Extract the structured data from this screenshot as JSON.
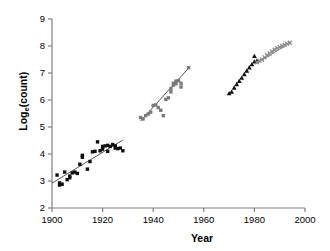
{
  "chart_data": {
    "type": "scatter",
    "title": "",
    "xlabel": "Year",
    "ylabel": "Log",
    "ylabel_sub": "e",
    "ylabel_tail": "(count)",
    "ylabel_full": "Log_e(count)",
    "xlim": [
      1900,
      2000
    ],
    "ylim": [
      2,
      9
    ],
    "xticks": [
      1900,
      1920,
      1940,
      1960,
      1980,
      2000
    ],
    "xtick_labels": [
      "1900",
      "1920",
      "1940",
      "1960",
      "1980",
      "2000"
    ],
    "yticks": [
      2,
      3,
      4,
      5,
      6,
      7,
      8,
      9
    ],
    "ytick_labels": [
      "2",
      "3",
      "4",
      "5",
      "6",
      "7",
      "8",
      "9"
    ],
    "grid": false,
    "legend": "none",
    "axis_color": "#808080",
    "series": [
      {
        "name": "early-period-black-squares",
        "marker": "square",
        "color": "#101010",
        "size": 3.4,
        "points": [
          [
            1902,
            3.22
          ],
          [
            1903,
            2.93
          ],
          [
            1903,
            2.85
          ],
          [
            1904,
            2.88
          ],
          [
            1905,
            3.33
          ],
          [
            1906,
            3.05
          ],
          [
            1907,
            3.18
          ],
          [
            1907,
            3.12
          ],
          [
            1908,
            3.3
          ],
          [
            1909,
            3.33
          ],
          [
            1910,
            3.28
          ],
          [
            1911,
            3.62
          ],
          [
            1912,
            3.95
          ],
          [
            1912,
            3.88
          ],
          [
            1914,
            3.44
          ],
          [
            1915,
            3.72
          ],
          [
            1916,
            4.08
          ],
          [
            1917,
            4.1
          ],
          [
            1918,
            4.45
          ],
          [
            1919,
            4.12
          ],
          [
            1920,
            4.18
          ],
          [
            1920,
            4.28
          ],
          [
            1921,
            4.3
          ],
          [
            1922,
            4.32
          ],
          [
            1922,
            4.1
          ],
          [
            1923,
            4.28
          ],
          [
            1924,
            4.35
          ],
          [
            1925,
            4.3
          ],
          [
            1925,
            4.22
          ],
          [
            1926,
            4.2
          ],
          [
            1927,
            4.22
          ],
          [
            1928,
            4.12
          ]
        ]
      },
      {
        "name": "mid-period-gray-squares",
        "marker": "square",
        "color": "#7a7a7a",
        "size": 3.4,
        "points": [
          [
            1935,
            5.35
          ],
          [
            1936,
            5.3
          ],
          [
            1937,
            5.42
          ],
          [
            1938,
            5.48
          ],
          [
            1939,
            5.55
          ],
          [
            1940,
            5.8
          ],
          [
            1941,
            5.82
          ],
          [
            1942,
            5.72
          ],
          [
            1943,
            5.62
          ],
          [
            1944,
            5.42
          ],
          [
            1945,
            6.02
          ],
          [
            1946,
            6.08
          ],
          [
            1947,
            6.3
          ],
          [
            1947,
            6.42
          ],
          [
            1948,
            6.55
          ],
          [
            1948,
            6.62
          ],
          [
            1949,
            6.7
          ],
          [
            1949,
            6.6
          ],
          [
            1950,
            6.72
          ],
          [
            1951,
            6.62
          ],
          [
            1951,
            6.48
          ],
          [
            1954,
            7.2
          ]
        ]
      },
      {
        "name": "late-period-black-triangles",
        "marker": "triangle",
        "color": "#101010",
        "size": 4.0,
        "points": [
          [
            1970,
            6.24
          ],
          [
            1971,
            6.3
          ],
          [
            1972,
            6.45
          ],
          [
            1973,
            6.58
          ],
          [
            1974,
            6.7
          ],
          [
            1975,
            6.82
          ],
          [
            1976,
            6.95
          ],
          [
            1977,
            7.08
          ],
          [
            1978,
            7.2
          ],
          [
            1979,
            7.32
          ],
          [
            1980,
            7.42
          ],
          [
            1980,
            7.62
          ],
          [
            1981,
            7.45
          ]
        ]
      },
      {
        "name": "late-period-gray-crosses",
        "marker": "cross",
        "color": "#8d8d8d",
        "size": 3.6,
        "points": [
          [
            1981,
            7.4
          ],
          [
            1982,
            7.45
          ],
          [
            1983,
            7.5
          ],
          [
            1984,
            7.58
          ],
          [
            1985,
            7.66
          ],
          [
            1986,
            7.72
          ],
          [
            1987,
            7.8
          ],
          [
            1988,
            7.86
          ],
          [
            1989,
            7.92
          ],
          [
            1990,
            7.96
          ],
          [
            1991,
            8.0
          ],
          [
            1992,
            8.04
          ],
          [
            1993,
            8.08
          ],
          [
            1994,
            8.12
          ]
        ]
      }
    ],
    "trend_lines": [
      {
        "name": "trend-early",
        "color": "#555555",
        "x1": 1900,
        "y1": 2.92,
        "x2": 1928,
        "y2": 4.52
      },
      {
        "name": "trend-mid",
        "color": "#555555",
        "x1": 1935,
        "y1": 5.22,
        "x2": 1954,
        "y2": 7.18
      },
      {
        "name": "trend-late",
        "color": "#777777",
        "x1": 1981,
        "y1": 7.36,
        "x2": 1994,
        "y2": 8.12
      }
    ]
  }
}
